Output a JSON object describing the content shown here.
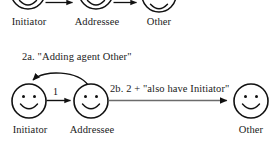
{
  "figure": {
    "background_color": "#ffffff",
    "stroke_color": "#111111",
    "gray_stroke_color": "#6b6b6b",
    "text_color": "#222222"
  },
  "top_row": {
    "caption_visible": false,
    "agents": [
      {
        "id": "initiator",
        "label": "Initiator",
        "cx": 28,
        "cy": -8,
        "r": 17
      },
      {
        "id": "addressee",
        "label": "Addressee",
        "cx": 96,
        "cy": -8,
        "r": 17
      },
      {
        "id": "other",
        "label": "Other",
        "cx": 159,
        "cy": -8,
        "r": 17
      }
    ],
    "arrows": [
      {
        "id": "top-arrow-1",
        "from": "initiator",
        "to": "addressee",
        "label": ""
      },
      {
        "id": "top-arrow-2",
        "from": "addressee",
        "to": "other",
        "label": ""
      }
    ]
  },
  "step_caption": {
    "id": "step-2a-caption",
    "text": "2a. \"Adding agent Other\""
  },
  "bottom_row": {
    "agents": [
      {
        "id": "initiator",
        "label": "Initiator",
        "cx": 29,
        "cy": 101,
        "r": 17
      },
      {
        "id": "addressee",
        "label": "Addressee",
        "cx": 91,
        "cy": 101,
        "r": 17
      },
      {
        "id": "other",
        "label": "Other",
        "cx": 251,
        "cy": 101,
        "r": 17
      }
    ],
    "arrows": [
      {
        "id": "arrow-initiator-to-addressee",
        "from": "initiator",
        "to": "addressee",
        "label": "1",
        "style": "black"
      },
      {
        "id": "arrow-addressee-to-initiator",
        "from": "addressee",
        "to": "initiator",
        "label": "2a. \"Adding agent Other\"",
        "style": "curved-black"
      },
      {
        "id": "arrow-addressee-to-other",
        "from": "addressee",
        "to": "other",
        "label": "2b. 2 + \"also have Initiator\"",
        "style": "gray"
      }
    ]
  }
}
